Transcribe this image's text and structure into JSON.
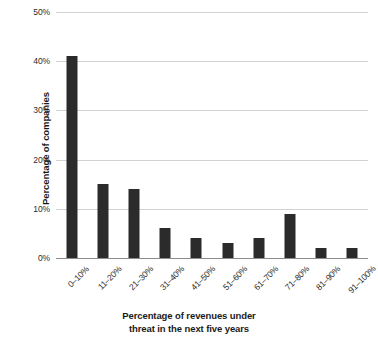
{
  "chart_data": {
    "type": "bar",
    "title": "",
    "xlabel": "Percentage of revenues under threat in the next five years",
    "ylabel": "Percentage of companies",
    "categories": [
      "0–10%",
      "11–20%",
      "21–30%",
      "31–40%",
      "41–50%",
      "51–60%",
      "61–70%",
      "71–80%",
      "81–90%",
      "91–100%"
    ],
    "values": [
      41,
      15,
      14,
      6,
      4,
      3,
      4,
      9,
      2,
      2
    ],
    "ylim": [
      0,
      50
    ],
    "yticks": [
      0,
      10,
      20,
      30,
      40,
      50
    ],
    "ytick_labels": [
      "0%",
      "10%",
      "20%",
      "30%",
      "40%",
      "50%"
    ],
    "grid": true,
    "grid_axis": "y",
    "legend": false,
    "bar_color": "#2b2b2b",
    "gridline_color": "#d2d2d2",
    "axis_color": "#8c8c8c",
    "background_color": "#ffffff",
    "xtick_rotation": -45
  },
  "axes": {
    "y_title": "Percentage of companies",
    "x_title_line1": "Percentage of revenues under",
    "x_title_line2": "threat in the next five years"
  }
}
